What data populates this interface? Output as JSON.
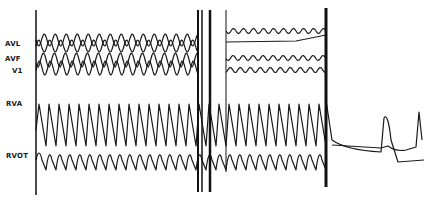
{
  "figure": {
    "type": "intracardiac-ecg-recording",
    "leads": [
      {
        "id": "avl",
        "label": "AVL",
        "y": 44
      },
      {
        "id": "avf",
        "label": "AVF",
        "y": 60
      },
      {
        "id": "v1",
        "label": "V1",
        "y": 72
      },
      {
        "id": "rva",
        "label": "RVA",
        "y": 106
      },
      {
        "id": "rvot",
        "label": "RVOT",
        "y": 158
      }
    ],
    "markers": {
      "start_x": 36,
      "shock_x1": 198,
      "shock_x2": 210,
      "mid_x": 226,
      "end_x": 326
    },
    "colors": {
      "trace": "#1a1a1a",
      "background": "#ffffff"
    }
  }
}
